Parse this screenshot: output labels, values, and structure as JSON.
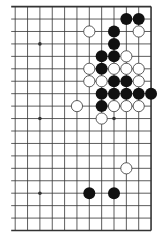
{
  "diagram": {
    "type": "go-board-fragment",
    "board_size": 19,
    "visible_columns": 12,
    "visible_rows": 19,
    "edges": {
      "top": true,
      "bottom": true,
      "right": true,
      "left": false
    },
    "colors": {
      "background": "#ffffff",
      "line": "#333333",
      "black_stone": "#111111",
      "white_stone_fill": "#ffffff",
      "white_stone_stroke": "#333333"
    },
    "star_points": [
      {
        "col": 2,
        "row": 3
      },
      {
        "col": 2,
        "row": 9
      },
      {
        "col": 2,
        "row": 15
      },
      {
        "col": 8,
        "row": 3
      },
      {
        "col": 8,
        "row": 9
      },
      {
        "col": 8,
        "row": 15
      }
    ],
    "stones": [
      {
        "color": "black",
        "col": 9,
        "row": 1
      },
      {
        "color": "black",
        "col": 10,
        "row": 1
      },
      {
        "color": "white",
        "col": 6,
        "row": 2
      },
      {
        "color": "black",
        "col": 8,
        "row": 2
      },
      {
        "color": "white",
        "col": 10,
        "row": 2
      },
      {
        "color": "black",
        "col": 8,
        "row": 3
      },
      {
        "color": "black",
        "col": 7,
        "row": 4
      },
      {
        "color": "black",
        "col": 8,
        "row": 4
      },
      {
        "color": "white",
        "col": 9,
        "row": 4
      },
      {
        "color": "white",
        "col": 6,
        "row": 5
      },
      {
        "color": "black",
        "col": 7,
        "row": 5
      },
      {
        "color": "white",
        "col": 8,
        "row": 5
      },
      {
        "color": "white",
        "col": 9,
        "row": 5
      },
      {
        "color": "white",
        "col": 10,
        "row": 5
      },
      {
        "color": "white",
        "col": 6,
        "row": 6
      },
      {
        "color": "white",
        "col": 7,
        "row": 6
      },
      {
        "color": "black",
        "col": 8,
        "row": 6
      },
      {
        "color": "black",
        "col": 9,
        "row": 6
      },
      {
        "color": "white",
        "col": 10,
        "row": 6
      },
      {
        "color": "black",
        "col": 7,
        "row": 7
      },
      {
        "color": "black",
        "col": 8,
        "row": 7
      },
      {
        "color": "black",
        "col": 9,
        "row": 7
      },
      {
        "color": "black",
        "col": 10,
        "row": 7
      },
      {
        "color": "black",
        "col": 11,
        "row": 7
      },
      {
        "color": "white",
        "col": 5,
        "row": 8
      },
      {
        "color": "black",
        "col": 7,
        "row": 8
      },
      {
        "color": "white",
        "col": 8,
        "row": 8
      },
      {
        "color": "white",
        "col": 9,
        "row": 8
      },
      {
        "color": "white",
        "col": 10,
        "row": 8
      },
      {
        "color": "white",
        "col": 7,
        "row": 9
      },
      {
        "color": "white",
        "col": 9,
        "row": 13
      },
      {
        "color": "black",
        "col": 6,
        "row": 15
      },
      {
        "color": "black",
        "col": 8,
        "row": 15
      }
    ],
    "summary": {
      "black_count": "15",
      "white_count": "18"
    }
  }
}
